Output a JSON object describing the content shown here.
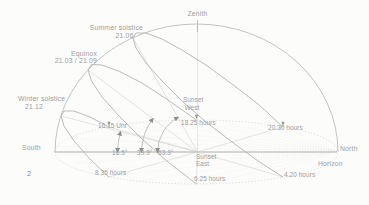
{
  "figure_number": "2",
  "axes": {
    "zenith": "Zenith",
    "south": "South",
    "north": "North",
    "horizon": "Horizon"
  },
  "sun_paths": {
    "summer_solstice": {
      "label": "Summer solstice",
      "date": "21.06",
      "noon_altitude": "63.3°",
      "sunrise_time": "4.20 hours",
      "sunset_time": "20.30 hours"
    },
    "equinox": {
      "label": "Equinox",
      "date": "21.03 / 21.09",
      "noon_altitude": "39.9°",
      "sunrise_time": "6.25 hours",
      "sunset_time": "18.25 hours"
    },
    "winter_solstice": {
      "label": "Winter solstice",
      "date": "21.12",
      "noon_altitude": "16.5°",
      "sunrise_time": "8.35 hours",
      "sunset_time": "16.15 Uhr"
    }
  },
  "horizon_points": {
    "west": {
      "line1": "Sunset",
      "line2": "West"
    },
    "east": {
      "line1": "Sunset",
      "line2": "East"
    }
  },
  "colors": {
    "path_line": "#a9a9a9",
    "meridian_line": "#b5b5b5",
    "text": "#9c9c9c",
    "figure_text": "#8a8a8a",
    "background": "#fcfcfb"
  }
}
